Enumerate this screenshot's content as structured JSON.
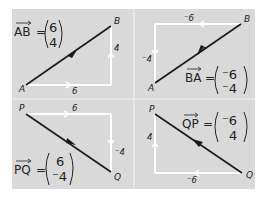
{
  "panels": [
    {
      "id": "AB",
      "vector_name": "AB",
      "equals": "=",
      "column": {
        "top": "6",
        "bottom": "4"
      },
      "start_point": "A",
      "end_point": "B",
      "horizontal_label": "6",
      "vertical_label": "4"
    },
    {
      "id": "BA",
      "vector_name": "BA",
      "equals": "=",
      "column": {
        "top": "⁻6",
        "bottom": "⁻4"
      },
      "start_point": "B",
      "end_point": "A",
      "horizontal_label": "⁻6",
      "vertical_label": "⁻4",
      "point_a": "A",
      "point_b": "B"
    },
    {
      "id": "PQ",
      "vector_name": "PQ",
      "equals": "=",
      "column": {
        "top": "6",
        "bottom": "⁻4"
      },
      "start_point": "P",
      "end_point": "Q",
      "horizontal_label": "6",
      "vertical_label": "⁻4"
    },
    {
      "id": "QP",
      "vector_name": "QP",
      "equals": "=",
      "column": {
        "top": "⁻6",
        "bottom": "4"
      },
      "start_point": "Q",
      "end_point": "P",
      "horizontal_label": "⁻6",
      "vertical_label": "4",
      "point_p": "P",
      "point_q": "Q"
    }
  ],
  "colors": {
    "panel_bg": "#d9d9d9",
    "grid": "#f2f2f2",
    "vector": "#1a1a1a",
    "component": "#ffffff"
  }
}
